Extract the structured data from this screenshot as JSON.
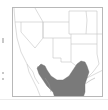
{
  "map": {
    "title": "",
    "region": "Southwestern United States and northern Mexico",
    "range_fill_color": "#7a7a7a",
    "border_color": "#b0b0b0",
    "background_color": "#ffffff",
    "legend": ""
  }
}
